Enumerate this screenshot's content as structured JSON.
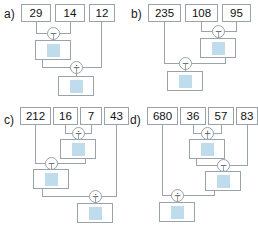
{
  "figure": {
    "type": "calculation-tree-worksheet",
    "panel_count": 4,
    "colors": {
      "box_border": "#9aa3a8",
      "line": "#9aa3a8",
      "result_swatch": "#bfdced",
      "text": "#111111",
      "background": "#ffffff"
    }
  },
  "panels": {
    "a": {
      "label": "a)",
      "inputs": [
        {
          "value": "29"
        },
        {
          "value": "14"
        },
        {
          "value": "12"
        }
      ],
      "operators": [
        {
          "symbol": "−",
          "name": "minus",
          "operands": [
            "29",
            "14"
          ],
          "step": 1
        },
        {
          "symbol": "÷",
          "name": "divide",
          "operands": [
            "result-1",
            "12"
          ],
          "step": 2
        }
      ],
      "results": [
        {
          "index": 1,
          "value": ""
        },
        {
          "index": 2,
          "value": ""
        }
      ]
    },
    "b": {
      "label": "b)",
      "inputs": [
        {
          "value": "235"
        },
        {
          "value": "108"
        },
        {
          "value": "95"
        }
      ],
      "operators": [
        {
          "symbol": "−",
          "name": "minus",
          "operands": [
            "108",
            "95"
          ],
          "step": 1
        },
        {
          "symbol": "−",
          "name": "minus",
          "operands": [
            "235",
            "result-1"
          ],
          "step": 2
        }
      ],
      "results": [
        {
          "index": 1,
          "value": ""
        },
        {
          "index": 2,
          "value": ""
        }
      ]
    },
    "c": {
      "label": "c)",
      "inputs": [
        {
          "value": "212"
        },
        {
          "value": "16"
        },
        {
          "value": "7"
        },
        {
          "value": "43"
        }
      ],
      "operators": [
        {
          "symbol": "÷",
          "name": "divide",
          "operands": [
            "16",
            "7"
          ],
          "step": 1
        },
        {
          "symbol": "−",
          "name": "minus",
          "operands": [
            "212",
            "result-1"
          ],
          "step": 2
        },
        {
          "symbol": "÷",
          "name": "divide",
          "operands": [
            "result-2",
            "43"
          ],
          "step": 3
        }
      ],
      "results": [
        {
          "index": 1,
          "value": ""
        },
        {
          "index": 2,
          "value": ""
        },
        {
          "index": 3,
          "value": ""
        }
      ]
    },
    "d": {
      "label": "d)",
      "inputs": [
        {
          "value": "680"
        },
        {
          "value": "36"
        },
        {
          "value": "57"
        },
        {
          "value": "83"
        }
      ],
      "operators": [
        {
          "symbol": "+",
          "name": "plus",
          "operands": [
            "36",
            "57"
          ],
          "step": 1
        },
        {
          "symbol": "−",
          "name": "minus",
          "operands": [
            "result-1",
            "83"
          ],
          "step": 2
        },
        {
          "symbol": "÷",
          "name": "divide",
          "operands": [
            "680",
            "result-2"
          ],
          "step": 3
        }
      ],
      "results": [
        {
          "index": 1,
          "value": ""
        },
        {
          "index": 2,
          "value": ""
        },
        {
          "index": 3,
          "value": ""
        }
      ]
    }
  }
}
